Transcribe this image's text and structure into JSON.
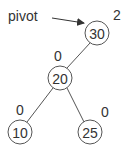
{
  "diagram": {
    "type": "binary-tree",
    "pointer": {
      "label": "pivot",
      "target": "30"
    },
    "nodes": [
      {
        "id": "30",
        "value": "30",
        "balance": "2",
        "cx": 97,
        "cy": 33,
        "bx": 117,
        "by": 20
      },
      {
        "id": "20",
        "value": "20",
        "balance": "0",
        "cx": 60,
        "cy": 78,
        "bx": 58,
        "by": 61
      },
      {
        "id": "10",
        "value": "10",
        "balance": "0",
        "cx": 20,
        "cy": 132,
        "bx": 20,
        "by": 115
      },
      {
        "id": "25",
        "value": "25",
        "balance": "0",
        "cx": 90,
        "cy": 132,
        "bx": 105,
        "by": 117
      }
    ],
    "edges": [
      {
        "from": "30",
        "to": "20"
      },
      {
        "from": "20",
        "to": "10"
      },
      {
        "from": "20",
        "to": "25"
      }
    ],
    "colors": {
      "stroke": "#555555",
      "text": "#333333",
      "fill": "#ffffff"
    }
  }
}
